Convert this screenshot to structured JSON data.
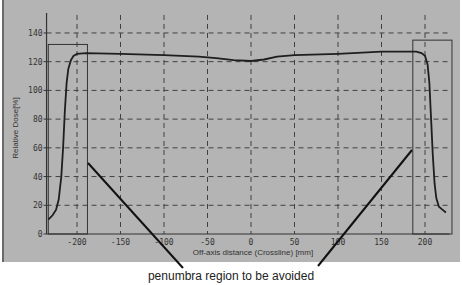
{
  "chart_data": {
    "type": "line",
    "title": "",
    "xlabel": "Off-axis distance (Crossline) [mm]",
    "ylabel": "Relative Dose[%]",
    "xlim": [
      -235,
      228
    ],
    "ylim": [
      0,
      140
    ],
    "x_ticks": [
      -200,
      -150,
      -100,
      -50,
      0,
      50,
      100,
      150,
      200
    ],
    "y_ticks": [
      0,
      20,
      40,
      60,
      80,
      100,
      120,
      140
    ],
    "grid": true,
    "grid_style": "dashed",
    "legend": "none",
    "series": [
      {
        "name": "Crossline profile",
        "x": [
          -233,
          -228,
          -224,
          -221,
          -218,
          -216,
          -214,
          -212,
          -210,
          -207,
          -204,
          -200,
          -190,
          -150,
          -100,
          -60,
          -40,
          -20,
          0,
          15,
          30,
          50,
          100,
          150,
          190,
          196,
          200,
          203,
          205,
          207,
          209,
          211,
          213,
          216,
          220,
          224
        ],
        "values": [
          10,
          13,
          17,
          24,
          40,
          60,
          85,
          105,
          115,
          121,
          124,
          125.5,
          126,
          125.5,
          124.5,
          123.5,
          122.5,
          121,
          120.5,
          121.5,
          123.5,
          124.5,
          125.5,
          127,
          127,
          126,
          124,
          118,
          105,
          80,
          55,
          35,
          25,
          19,
          17,
          15
        ]
      }
    ],
    "annotations": [
      {
        "type": "rect",
        "label": "left penumbra region",
        "x_range": [
          -233,
          -188
        ],
        "y_range": [
          0,
          132
        ]
      },
      {
        "type": "rect",
        "label": "right penumbra region",
        "x_range": [
          186,
          231
        ],
        "y_range": [
          0,
          135
        ]
      },
      {
        "type": "text",
        "text": "penumbra region to be avoided"
      }
    ]
  },
  "annotation_text": "penumbra region to be avoided",
  "axis": {
    "xlabel": "Off-axis distance (Crossline) [mm]",
    "ylabel": "Relative Dose[%]"
  },
  "colors": {
    "background": "#b4b4b4",
    "curve": "#1e1e1e",
    "grid": "#404040"
  }
}
